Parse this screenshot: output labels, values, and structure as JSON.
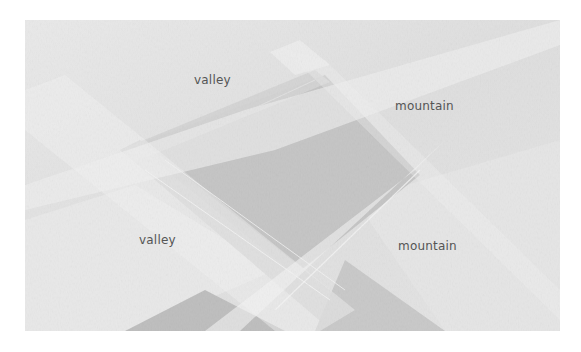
{
  "figure": {
    "labels": [
      {
        "text": "valley",
        "x": 194,
        "y": 73
      },
      {
        "text": "mountain",
        "x": 395,
        "y": 99
      },
      {
        "text": "valley",
        "x": 139,
        "y": 233
      },
      {
        "text": "mountain",
        "x": 398,
        "y": 239
      }
    ],
    "colors": {
      "background": "#ffffff",
      "paper_light": "#ebebeb",
      "paper_mid": "#d2d2d2",
      "paper_shadow": "#b9b9b9",
      "label_text": "#555555"
    }
  }
}
